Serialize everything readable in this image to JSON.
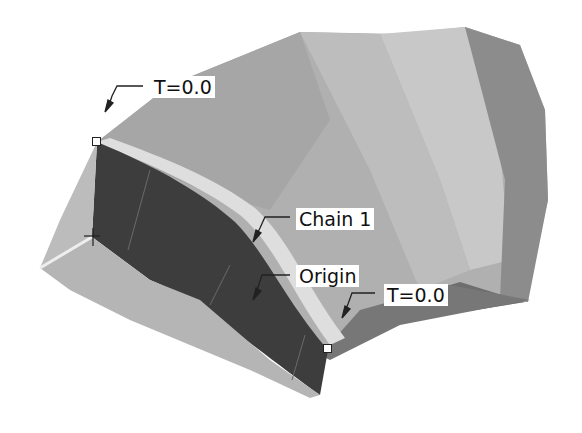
{
  "figure": {
    "labels": {
      "t_start_top": "T=0.0",
      "chain": "Chain 1",
      "origin": "Origin",
      "t_start_bottom": "T=0.0"
    },
    "colors": {
      "background": "#ffffff",
      "surface_light": "#c4c4c4",
      "surface_mid": "#a9a9a9",
      "surface_dark": "#8a8a8a",
      "surface_darkest": "#3c3c3c",
      "highlight_band": "#d9d9d9",
      "label_bg": "#ffffff",
      "label_text": "#111111"
    }
  }
}
